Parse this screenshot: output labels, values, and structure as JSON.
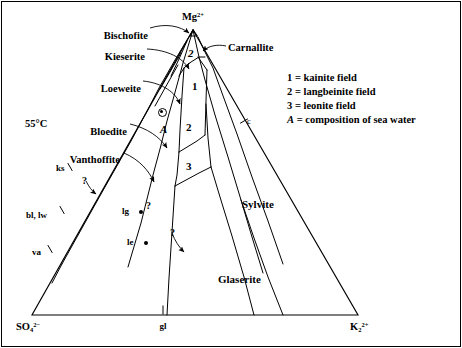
{
  "figure": {
    "temperature_label": "55°C",
    "background_color": "#ffffff",
    "line_color": "#000000",
    "width": 462,
    "height": 348
  },
  "corners": {
    "top": {
      "text": "Mg",
      "sub": "",
      "sup": "2+",
      "x": 193,
      "y": 12
    },
    "bottom_left": {
      "text": "SO",
      "sub": "4",
      "sup": "2−",
      "x": 16,
      "y": 322
    },
    "bottom_right": {
      "text": "K",
      "sub": "2",
      "sup": "2+",
      "x": 350,
      "y": 322
    },
    "bottom_mid_tick": {
      "text": "gl",
      "x": 163,
      "y": 322
    }
  },
  "leader_labels": [
    {
      "id": "bischofite",
      "text": "Bischofite",
      "x": 148,
      "y": 31,
      "align": "end"
    },
    {
      "id": "kieserite",
      "text": "Kieserite",
      "x": 145,
      "y": 52,
      "align": "end"
    },
    {
      "id": "loeweite",
      "text": "Loeweite",
      "x": 141,
      "y": 84,
      "align": "end"
    },
    {
      "id": "bloedite",
      "text": "Bloedite",
      "x": 127,
      "y": 127,
      "align": "end"
    },
    {
      "id": "vanthoffite",
      "text": "Vanthoffite",
      "x": 120,
      "y": 155,
      "align": "end"
    },
    {
      "id": "carnallite",
      "text": "Carnallite",
      "x": 228,
      "y": 43,
      "align": "start"
    }
  ],
  "region_labels": [
    {
      "id": "sylvite",
      "text": "Sylvite",
      "x": 242,
      "y": 199
    },
    {
      "id": "glaserite",
      "text": "Glaserite",
      "x": 218,
      "y": 274
    }
  ],
  "field_numbers": [
    {
      "id": "field-1",
      "text": "1",
      "x": 192,
      "y": 81
    },
    {
      "id": "field-2",
      "text": "2",
      "x": 186,
      "y": 122
    },
    {
      "id": "field-3",
      "text": "3",
      "x": 186,
      "y": 161
    },
    {
      "id": "field-z",
      "text": "2",
      "x": 188,
      "y": 48,
      "italic": true
    }
  ],
  "point_markers": [
    {
      "id": "seawater",
      "label": "A",
      "x": 162,
      "y": 112,
      "label_x": 160,
      "label_y": 124
    },
    {
      "id": "lg",
      "label": "lg",
      "x": 141,
      "y": 212,
      "label_x": 122,
      "label_y": 207
    },
    {
      "id": "le",
      "label": "le",
      "x": 146,
      "y": 243,
      "label_x": 127,
      "label_y": 238
    }
  ],
  "edge_tick_labels": [
    {
      "id": "ks",
      "text": "ks",
      "x": 56,
      "y": 164
    },
    {
      "id": "bl-lw",
      "text": "bl, lw",
      "x": 26,
      "y": 211
    },
    {
      "id": "va",
      "text": "va",
      "x": 32,
      "y": 248
    },
    {
      "id": "c-tick",
      "text": "c",
      "x": 247,
      "y": 117
    }
  ],
  "question_marks": [
    {
      "id": "q1",
      "x": 82,
      "y": 176
    },
    {
      "id": "q2",
      "x": 146,
      "y": 201
    },
    {
      "id": "q3",
      "x": 170,
      "y": 228
    }
  ],
  "legend": {
    "x": 287,
    "y": 72,
    "entries": [
      {
        "key": "1",
        "italic": false,
        "text": " = kainite field"
      },
      {
        "key": "2",
        "italic": false,
        "text": " = langbeinite field"
      },
      {
        "key": "3",
        "italic": false,
        "text": " = leonite field"
      },
      {
        "key": "A",
        "italic": true,
        "text": " = composition of sea water"
      }
    ]
  },
  "chart_data": {
    "type": "diagram",
    "subtype": "ternary-phase-diagram",
    "axes": {
      "apex": "Mg2+",
      "left_base": "SO4 2-",
      "right_base": "K2 2+"
    },
    "triangle": {
      "apex": [
        193,
        30
      ],
      "left": [
        32,
        315
      ],
      "right": [
        358,
        315
      ]
    },
    "phase_fields": [
      "Bischofite",
      "Kieserite",
      "Loeweite",
      "Bloedite",
      "Vanthoffite",
      "Carnallite",
      "Sylvite",
      "Glaserite",
      "kainite field (1)",
      "langbeinite field (2)",
      "leonite field (3)"
    ],
    "annotated_points": [
      {
        "name": "A",
        "meaning": "composition of sea water",
        "pos": [
          162,
          112
        ]
      },
      {
        "name": "lg",
        "pos": [
          141,
          212
        ]
      },
      {
        "name": "le",
        "pos": [
          146,
          243
        ]
      }
    ],
    "uncertain_boundaries": 3,
    "temperature_c": 55
  },
  "geometry": {
    "outer_frame": "M2,2 L460,2 L460,346 L2,346 Z",
    "triangle": "M193,30 L358,315 L32,315 Z",
    "boundary_paths": [
      "M193,30 L175,60 L159,88 L146,113 L131,141 L118,164 L101,194 L77,237 L62,264",
      "M193,30 L183,63 L174,96 L167,121 L160,149 L153,175 L147,199 L141,223 L133,250 L128,267",
      "M193,30 L199,57 L205,80 L215,115 L228,157 L241,200 L252,237 L263,273",
      "M198,37 L205,52 L213,68 L222,93 L237,134 L252,177 L268,221 L283,264",
      "M187,41 L179,59 L171,76",
      "M181,53 L170,72 L160,89",
      "M178,65 L165,88 L155,106",
      "M205,57 L199,57 L191,62 L184,68 L179,76",
      "M189,63 L184,68",
      "M184,68 L182,96 L180,130 L179,152",
      "M179,152 L197,141 L205,135",
      "M179,152 L177,175 L175,186",
      "M175,186 L199,173 L211,167",
      "M205,135 L206,101 L207,70",
      "M207,70 L198,57",
      "M211,167 L208,138 L206,104",
      "M175,186 L172,232 L169,278 L167,315",
      "M211,167 L220,197 L232,236 L244,277 L254,315",
      "M62,264 L52,283",
      "M241,200 L254,238 L268,277 L283,315",
      "M193,30 L190,36 L197,36 Z"
    ],
    "leader_lines": [
      "M150,28 C166,23 180,26 189,33",
      "M147,49 C168,50 183,58 189,69",
      "M143,81 C163,83 176,93 180,104",
      "M130,124 C147,128 160,137 167,148",
      "M124,153 C140,160 149,171 154,182",
      "M226,46 C217,44 208,46 203,51"
    ],
    "arrow_heads": [
      {
        "x": 189,
        "y": 33,
        "angle": 38
      },
      {
        "x": 189,
        "y": 69,
        "angle": 58
      },
      {
        "x": 180,
        "y": 104,
        "angle": 66
      },
      {
        "x": 167,
        "y": 148,
        "angle": 58
      },
      {
        "x": 154,
        "y": 182,
        "angle": 62
      },
      {
        "x": 203,
        "y": 51,
        "angle": 222
      }
    ],
    "edge_ticks": [
      {
        "x": 70,
        "y": 167,
        "angle": 60
      },
      {
        "x": 62,
        "y": 210,
        "angle": 60
      },
      {
        "x": 50,
        "y": 249,
        "angle": 60
      },
      {
        "x": 244,
        "y": 121,
        "angle": 150
      },
      {
        "x": 163,
        "y": 310,
        "angle": 90
      }
    ],
    "q_leaders": [
      "M86,181 C89,187 92,191 96,194",
      "M172,233 C175,241 179,247 184,252"
    ]
  }
}
